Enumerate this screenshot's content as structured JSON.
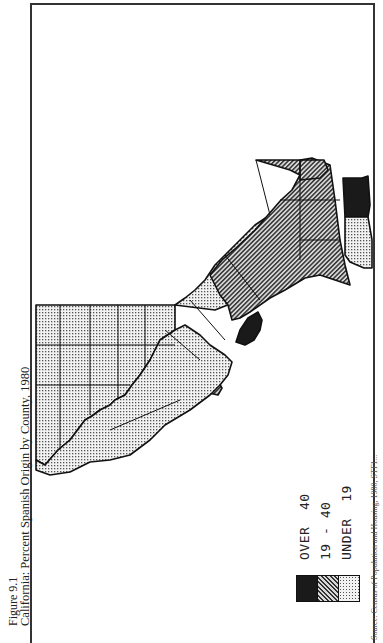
{
  "figure": {
    "number": "Figure 9.1",
    "title": "California: Percent Spanish Origin by County, 1980",
    "source": "Source: Census of Population and Housing, 1980, STF1..."
  },
  "map": {
    "orientation": "rotated 90° counter-clockwise (north at left)",
    "region": "California counties",
    "patterns": {
      "over_40": {
        "fill": "solid-black",
        "color": "#1a1a1a"
      },
      "19_40": {
        "fill": "diagonal-hatch",
        "color": "#555555"
      },
      "under_19": {
        "fill": "dot-stipple",
        "color": "#888888"
      }
    }
  },
  "legend": {
    "items": [
      {
        "label": "OVER  40",
        "pattern": "solid-black"
      },
      {
        "label": "19 - 40",
        "pattern": "diagonal-hatch"
      },
      {
        "label": "UNDER  19",
        "pattern": "dot-stipple"
      }
    ]
  }
}
